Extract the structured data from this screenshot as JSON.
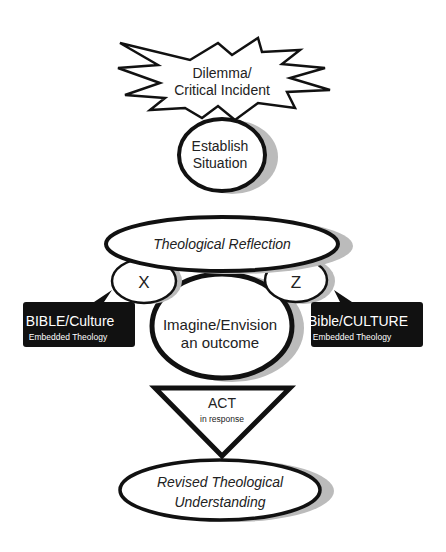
{
  "diagram": {
    "burst": {
      "line1": "Dilemma/",
      "line2": "Critical Incident"
    },
    "establish": {
      "line1": "Establish",
      "line2": "Situation"
    },
    "reflection": {
      "label": "Theological Reflection"
    },
    "x": {
      "label": "X"
    },
    "z": {
      "label": "Z"
    },
    "left_box": {
      "title": "BIBLE/Culture",
      "subtitle": "Embedded Theology"
    },
    "right_box": {
      "title": "Bible/CULTURE",
      "subtitle": "Embedded Theology"
    },
    "imagine": {
      "line1": "Imagine/Envision",
      "line2": "an outcome"
    },
    "act": {
      "title": "ACT",
      "subtitle": "in response"
    },
    "revised": {
      "line1": "Revised Theological",
      "line2": "Understanding"
    }
  }
}
